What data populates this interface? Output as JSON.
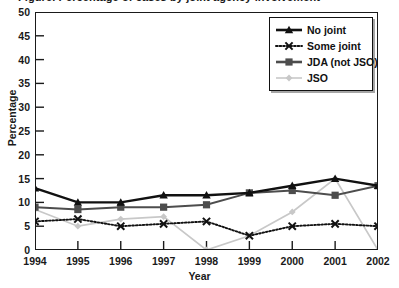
{
  "title": "Figure. Percentage of cases by joint agency involvement",
  "axes": {
    "ylabel": "Percentage",
    "xlabel": "Year",
    "yticks": [
      0,
      5,
      10,
      15,
      20,
      25,
      30,
      35,
      40,
      45,
      50
    ],
    "xticks": [
      "1994",
      "1995",
      "1996",
      "1997",
      "1998",
      "1999",
      "2000",
      "2001",
      "2002"
    ]
  },
  "legend": {
    "items": [
      {
        "label": "No joint",
        "color": "#111111",
        "style": "solid",
        "marker": "triangle"
      },
      {
        "label": "Some joint",
        "color": "#111111",
        "style": "dotted",
        "marker": "cross"
      },
      {
        "label": "JDA (not JSO)",
        "color": "#4d4d4d",
        "style": "solid",
        "marker": "square"
      },
      {
        "label": "JSO",
        "color": "#c8c8c8",
        "style": "solid",
        "marker": "diamond"
      }
    ]
  },
  "chart_data": {
    "type": "line",
    "title": "Figure. Percentage of cases by joint agency involvement",
    "xlabel": "Year",
    "ylabel": "Percentage",
    "categories": [
      "1994",
      "1995",
      "1996",
      "1997",
      "1998",
      "1999",
      "2000",
      "2001",
      "2002"
    ],
    "x": [
      1994,
      1995,
      1996,
      1997,
      1998,
      1999,
      2000,
      2001,
      2002
    ],
    "ylim": [
      0,
      50
    ],
    "xlim": [
      1994,
      2002
    ],
    "ytick_step": 5,
    "grid": false,
    "legend_position": "top-right",
    "series": [
      {
        "name": "No joint",
        "color": "#111111",
        "linestyle": "solid",
        "marker": "triangle",
        "values": [
          13,
          10,
          10,
          11.5,
          11.5,
          12,
          13.5,
          15,
          13.5
        ]
      },
      {
        "name": "Some joint",
        "color": "#111111",
        "linestyle": "dotted",
        "marker": "cross",
        "values": [
          6,
          6.5,
          5,
          5.5,
          6,
          3,
          5,
          5.5,
          5
        ]
      },
      {
        "name": "JDA (not JSO)",
        "color": "#4d4d4d",
        "linestyle": "solid",
        "marker": "square",
        "values": [
          9,
          8.5,
          9,
          9,
          9.5,
          12,
          12.5,
          11.5,
          13.5
        ]
      },
      {
        "name": "JSO",
        "color": "#c8c8c8",
        "linestyle": "solid",
        "marker": "diamond",
        "values": [
          8.5,
          5,
          6.5,
          7,
          0,
          3,
          8,
          15,
          0
        ]
      }
    ]
  }
}
